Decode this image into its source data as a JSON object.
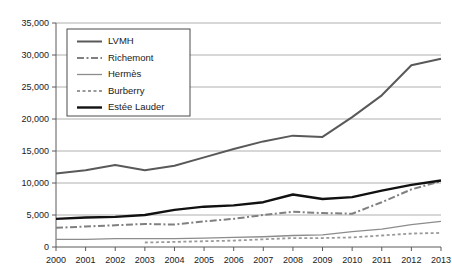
{
  "chart_data": {
    "type": "line",
    "title": "",
    "subtitle": "",
    "xlabel": "",
    "ylabel": "",
    "categories": [
      "2000",
      "2001",
      "2002",
      "2003",
      "2004",
      "2005",
      "2006",
      "2007",
      "2008",
      "2009",
      "2010",
      "2011",
      "2012",
      "2013"
    ],
    "x": [
      2000,
      2001,
      2002,
      2003,
      2004,
      2005,
      2006,
      2007,
      2008,
      2009,
      2010,
      2011,
      2012,
      2013
    ],
    "xlim": [
      2000,
      2013
    ],
    "ylim": [
      0,
      35000
    ],
    "y_ticks": [
      0,
      5000,
      10000,
      15000,
      20000,
      25000,
      30000,
      35000
    ],
    "y_tick_labels": [
      "0",
      "5,000",
      "10,000",
      "15,000",
      "20,000",
      "25,000",
      "30,000",
      "35,000"
    ],
    "x_tick_labels": [
      "2000",
      "2001",
      "2002",
      "2003",
      "2004",
      "2005",
      "2006",
      "2007",
      "2008",
      "2009",
      "2010",
      "2011",
      "2012",
      "2013"
    ],
    "grid": true,
    "grid_axis": "y",
    "legend_position": "upper-left-inside",
    "series": [
      {
        "name": "LVMH",
        "style": "solid",
        "color": "#595959",
        "width": 2.0,
        "values": [
          11500,
          12000,
          12800,
          12000,
          12700,
          14000,
          15300,
          16500,
          17400,
          17200,
          20300,
          23700,
          28400,
          29400
        ]
      },
      {
        "name": "Richemont",
        "style": "dash-dot",
        "color": "#808080",
        "width": 2.0,
        "values": [
          3000,
          3200,
          3400,
          3600,
          3500,
          4000,
          4400,
          5000,
          5500,
          5300,
          5200,
          7000,
          9000,
          10300
        ]
      },
      {
        "name": "Hermès",
        "style": "solid",
        "color": "#8c8c8c",
        "width": 1.3,
        "values": [
          1200,
          1200,
          1300,
          1300,
          1300,
          1400,
          1500,
          1600,
          1800,
          1900,
          2400,
          2800,
          3500,
          4000
        ]
      },
      {
        "name": "Burberry",
        "style": "dotted",
        "color": "#999999",
        "width": 1.8,
        "values": [
          null,
          null,
          null,
          700,
          800,
          900,
          1000,
          1200,
          1400,
          1400,
          1500,
          1800,
          2100,
          2200
        ]
      },
      {
        "name": "Estée Lauder",
        "style": "solid",
        "color": "#111111",
        "width": 2.4,
        "values": [
          4400,
          4600,
          4700,
          5000,
          5800,
          6300,
          6500,
          7000,
          8200,
          7500,
          7800,
          8800,
          9700,
          10400
        ]
      }
    ]
  },
  "legend": {
    "items": [
      {
        "label": "LVMH"
      },
      {
        "label": "Richemont"
      },
      {
        "label": "Hermès"
      },
      {
        "label": "Burberry"
      },
      {
        "label": "Estée Lauder"
      }
    ]
  }
}
